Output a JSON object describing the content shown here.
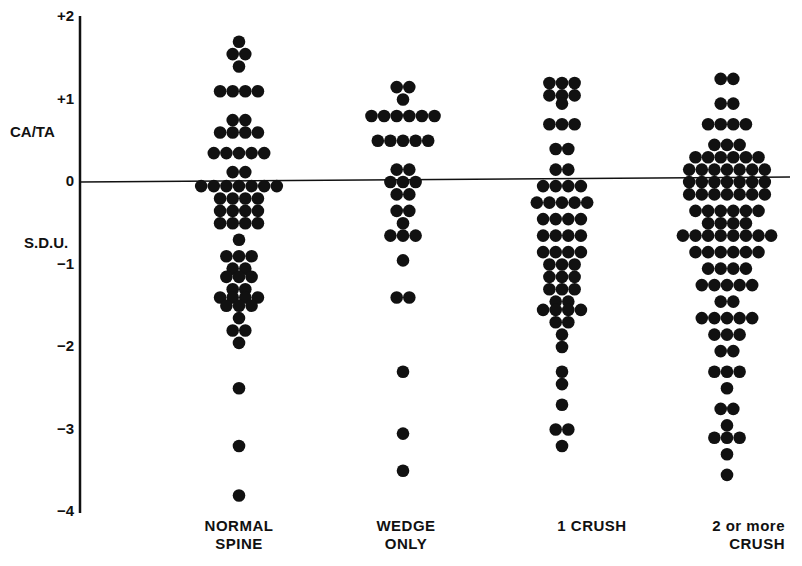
{
  "chart_data": {
    "type": "scatter",
    "subtype": "dot-strip-plot",
    "title": "",
    "ylabel_top": "CA/TA",
    "ylabel_bottom": "S.D.U.",
    "ylim": [
      -4,
      2
    ],
    "yticks": [
      {
        "label": "+2",
        "value": 2
      },
      {
        "label": "+1",
        "value": 1
      },
      {
        "label": "0",
        "value": 0
      },
      {
        "label": "-1",
        "value": -1
      },
      {
        "label": "-2",
        "value": -2
      },
      {
        "label": "-3",
        "value": -3
      },
      {
        "label": "-4",
        "value": -4
      }
    ],
    "reference_line": 0,
    "grid": false,
    "categories": [
      {
        "line1": "NORMAL",
        "line2": "SPINE"
      },
      {
        "line1": "WEDGE",
        "line2": "ONLY"
      },
      {
        "line1": "1 CRUSH",
        "line2": ""
      },
      {
        "line1": "2 or more",
        "line2": "CRUSH"
      }
    ],
    "series": [
      {
        "name": "NORMAL SPINE",
        "center_x": 239,
        "rows": [
          {
            "value": 1.7,
            "count": 1
          },
          {
            "value": 1.55,
            "count": 2
          },
          {
            "value": 1.4,
            "count": 1
          },
          {
            "value": 1.1,
            "count": 4
          },
          {
            "value": 0.75,
            "count": 2
          },
          {
            "value": 0.6,
            "count": 4
          },
          {
            "value": 0.35,
            "count": 5
          },
          {
            "value": 0.12,
            "count": 2
          },
          {
            "value": -0.05,
            "count": 7
          },
          {
            "value": -0.2,
            "count": 4
          },
          {
            "value": -0.35,
            "count": 4
          },
          {
            "value": -0.5,
            "count": 4
          },
          {
            "value": -0.7,
            "count": 1
          },
          {
            "value": -0.9,
            "count": 3
          },
          {
            "value": -1.05,
            "count": 2
          },
          {
            "value": -1.15,
            "count": 3
          },
          {
            "value": -1.3,
            "count": 2
          },
          {
            "value": -1.4,
            "count": 4
          },
          {
            "value": -1.5,
            "count": 3
          },
          {
            "value": -1.65,
            "count": 1
          },
          {
            "value": -1.8,
            "count": 2
          },
          {
            "value": -1.95,
            "count": 1
          },
          {
            "value": -2.5,
            "count": 1
          },
          {
            "value": -3.2,
            "count": 1
          },
          {
            "value": -3.8,
            "count": 1
          }
        ]
      },
      {
        "name": "WEDGE ONLY",
        "center_x": 403,
        "rows": [
          {
            "value": 1.15,
            "count": 2
          },
          {
            "value": 1.0,
            "count": 1
          },
          {
            "value": 0.8,
            "count": 6
          },
          {
            "value": 0.5,
            "count": 5
          },
          {
            "value": 0.15,
            "count": 2
          },
          {
            "value": 0.0,
            "count": 3
          },
          {
            "value": -0.15,
            "count": 2
          },
          {
            "value": -0.35,
            "count": 2
          },
          {
            "value": -0.5,
            "count": 1
          },
          {
            "value": -0.65,
            "count": 3
          },
          {
            "value": -0.95,
            "count": 1
          },
          {
            "value": -1.4,
            "count": 2
          },
          {
            "value": -2.3,
            "count": 1
          },
          {
            "value": -3.05,
            "count": 1
          },
          {
            "value": -3.5,
            "count": 1
          }
        ]
      },
      {
        "name": "1 CRUSH",
        "center_x": 562,
        "rows": [
          {
            "value": 1.2,
            "count": 3
          },
          {
            "value": 1.05,
            "count": 3
          },
          {
            "value": 0.95,
            "count": 1
          },
          {
            "value": 0.7,
            "count": 3
          },
          {
            "value": 0.4,
            "count": 2
          },
          {
            "value": 0.15,
            "count": 2
          },
          {
            "value": -0.05,
            "count": 4
          },
          {
            "value": -0.25,
            "count": 5
          },
          {
            "value": -0.45,
            "count": 4
          },
          {
            "value": -0.65,
            "count": 4
          },
          {
            "value": -0.85,
            "count": 4
          },
          {
            "value": -1.0,
            "count": 3
          },
          {
            "value": -1.15,
            "count": 3
          },
          {
            "value": -1.3,
            "count": 3
          },
          {
            "value": -1.45,
            "count": 2
          },
          {
            "value": -1.55,
            "count": 4
          },
          {
            "value": -1.7,
            "count": 2
          },
          {
            "value": -1.85,
            "count": 1
          },
          {
            "value": -2.0,
            "count": 1
          },
          {
            "value": -2.3,
            "count": 1
          },
          {
            "value": -2.45,
            "count": 1
          },
          {
            "value": -2.7,
            "count": 1
          },
          {
            "value": -3.0,
            "count": 2
          },
          {
            "value": -3.2,
            "count": 1
          }
        ]
      },
      {
        "name": "2 or more CRUSH",
        "center_x": 727,
        "rows": [
          {
            "value": 1.25,
            "count": 2
          },
          {
            "value": 0.95,
            "count": 2
          },
          {
            "value": 0.7,
            "count": 4
          },
          {
            "value": 0.45,
            "count": 3
          },
          {
            "value": 0.3,
            "count": 6
          },
          {
            "value": 0.15,
            "count": 7
          },
          {
            "value": 0.0,
            "count": 7
          },
          {
            "value": -0.15,
            "count": 7
          },
          {
            "value": -0.35,
            "count": 6
          },
          {
            "value": -0.5,
            "count": 4
          },
          {
            "value": -0.65,
            "count": 8
          },
          {
            "value": -0.85,
            "count": 6
          },
          {
            "value": -1.05,
            "count": 4
          },
          {
            "value": -1.25,
            "count": 5
          },
          {
            "value": -1.45,
            "count": 2
          },
          {
            "value": -1.65,
            "count": 5
          },
          {
            "value": -1.85,
            "count": 3
          },
          {
            "value": -2.05,
            "count": 2
          },
          {
            "value": -2.3,
            "count": 3
          },
          {
            "value": -2.5,
            "count": 1
          },
          {
            "value": -2.75,
            "count": 2
          },
          {
            "value": -2.95,
            "count": 1
          },
          {
            "value": -3.1,
            "count": 3
          },
          {
            "value": -3.3,
            "count": 1
          },
          {
            "value": -3.55,
            "count": 1
          }
        ]
      }
    ]
  }
}
